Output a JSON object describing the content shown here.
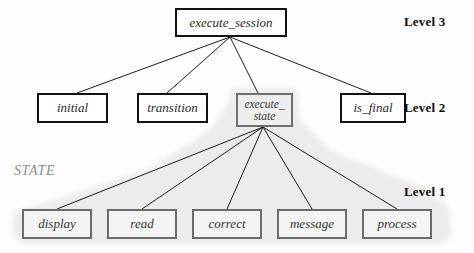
{
  "diagram": {
    "background_color": "#fdfdfd",
    "shaded_region_color": "#ececec",
    "levels": [
      {
        "id": "level3",
        "label": "Level 3",
        "x": 404,
        "y": 14
      },
      {
        "id": "level2",
        "label": "Level 2",
        "x": 404,
        "y": 100
      },
      {
        "id": "level1",
        "label": "Level 1",
        "x": 404,
        "y": 184
      }
    ],
    "group_labels": [
      {
        "id": "state-group",
        "label": "STATE",
        "x": 14,
        "y": 163
      }
    ],
    "nodes": [
      {
        "id": "execute-session",
        "label": "execute_session",
        "level": 3,
        "style": "plain",
        "x": 175,
        "y": 8,
        "w": 112,
        "h": 29,
        "font_size": 13
      },
      {
        "id": "initial",
        "label": "initial",
        "level": 2,
        "style": "plain",
        "x": 37,
        "y": 93,
        "w": 71,
        "h": 30,
        "font_size": 13
      },
      {
        "id": "transition",
        "label": "transition",
        "level": 2,
        "style": "plain",
        "x": 137,
        "y": 93,
        "w": 71,
        "h": 30,
        "font_size": 13
      },
      {
        "id": "execute-state",
        "label": "execute_\nstate",
        "level": 2,
        "style": "shaded",
        "x": 236,
        "y": 93,
        "w": 57,
        "h": 34,
        "font_size": 11.5
      },
      {
        "id": "is-final",
        "label": "is_final",
        "level": 2,
        "style": "plain",
        "x": 340,
        "y": 93,
        "w": 66,
        "h": 30,
        "font_size": 13
      },
      {
        "id": "display",
        "label": "display",
        "level": 1,
        "style": "l1",
        "x": 22,
        "y": 209,
        "w": 70,
        "h": 30,
        "font_size": 13
      },
      {
        "id": "read",
        "label": "read",
        "level": 1,
        "style": "l1",
        "x": 107,
        "y": 209,
        "w": 70,
        "h": 30,
        "font_size": 13
      },
      {
        "id": "correct",
        "label": "correct",
        "level": 1,
        "style": "l1",
        "x": 192,
        "y": 209,
        "w": 70,
        "h": 30,
        "font_size": 13
      },
      {
        "id": "message",
        "label": "message",
        "level": 1,
        "style": "l1",
        "x": 277,
        "y": 209,
        "w": 70,
        "h": 30,
        "font_size": 13
      },
      {
        "id": "process",
        "label": "process",
        "level": 1,
        "style": "l1",
        "x": 362,
        "y": 209,
        "w": 70,
        "h": 30,
        "font_size": 13
      }
    ],
    "edges": [
      {
        "id": "e1",
        "from": "execute-session",
        "to": "initial",
        "x1": 230,
        "y1": 37,
        "x2": 77,
        "y2": 93
      },
      {
        "id": "e2",
        "from": "execute-session",
        "to": "transition",
        "x1": 230,
        "y1": 37,
        "x2": 167,
        "y2": 93
      },
      {
        "id": "e3",
        "from": "execute-session",
        "to": "execute-state",
        "x1": 230,
        "y1": 37,
        "x2": 258,
        "y2": 93
      },
      {
        "id": "e4",
        "from": "execute-session",
        "to": "is-final",
        "x1": 230,
        "y1": 37,
        "x2": 371,
        "y2": 93
      },
      {
        "id": "e5",
        "from": "execute-state",
        "to": "display",
        "x1": 263,
        "y1": 127,
        "x2": 57,
        "y2": 209
      },
      {
        "id": "e6",
        "from": "execute-state",
        "to": "read",
        "x1": 263,
        "y1": 127,
        "x2": 142,
        "y2": 209
      },
      {
        "id": "e7",
        "from": "execute-state",
        "to": "correct",
        "x1": 263,
        "y1": 127,
        "x2": 227,
        "y2": 209
      },
      {
        "id": "e8",
        "from": "execute-state",
        "to": "message",
        "x1": 263,
        "y1": 127,
        "x2": 312,
        "y2": 209
      },
      {
        "id": "e9",
        "from": "execute-state",
        "to": "process",
        "x1": 263,
        "y1": 127,
        "x2": 397,
        "y2": 209
      }
    ]
  }
}
